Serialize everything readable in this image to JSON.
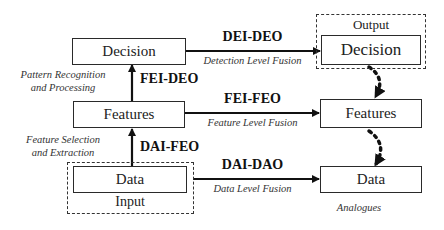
{
  "diagram": {
    "left_column": {
      "decision_box": "Decision",
      "features_box": "Features",
      "data_box": "Data",
      "input_label": "Input"
    },
    "right_column": {
      "output_label": "Output",
      "decision_box": "Decision",
      "features_box": "Features",
      "data_box": "Data",
      "analogues_label": "Analogues"
    },
    "vertical_arrows": [
      {
        "code": "FEI-DEO",
        "description_line1": "Pattern Recognition",
        "description_line2": "and Processing"
      },
      {
        "code": "DAI-FEO",
        "description_line1": "Feature Selection",
        "description_line2": "and Extraction"
      }
    ],
    "horizontal_arrows": [
      {
        "code": "DEI-DEO",
        "description": "Detection Level Fusion"
      },
      {
        "code": "FEI-FEO",
        "description": "Feature Level Fusion"
      },
      {
        "code": "DAI-DAO",
        "description": "Data Level Fusion"
      }
    ]
  }
}
